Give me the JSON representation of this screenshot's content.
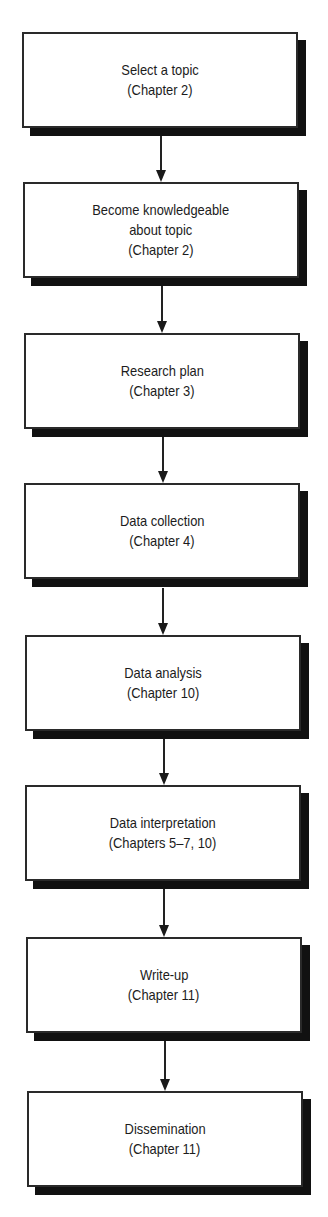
{
  "flowchart": {
    "steps": [
      {
        "lines": [
          "Select a topic",
          "(Chapter 2)"
        ],
        "x": 22,
        "y": 32
      },
      {
        "lines": [
          "Become knowledgeable",
          "about topic",
          "(Chapter 2)"
        ],
        "x": 23,
        "y": 182
      },
      {
        "lines": [
          "Research plan",
          "(Chapter 3)"
        ],
        "x": 24,
        "y": 333
      },
      {
        "lines": [
          "Data collection",
          "(Chapter 4)"
        ],
        "x": 24,
        "y": 483
      },
      {
        "lines": [
          "Data analysis",
          "(Chapter 10)"
        ],
        "x": 25,
        "y": 635
      },
      {
        "lines": [
          "Data interpretation",
          "(Chapters 5–7, 10)"
        ],
        "x": 25,
        "y": 785
      },
      {
        "lines": [
          "Write-up",
          "(Chapter 11)"
        ],
        "x": 26,
        "y": 937
      },
      {
        "lines": [
          "Dissemination",
          "(Chapter 11)"
        ],
        "x": 27,
        "y": 1091
      }
    ],
    "arrows": [
      {
        "x": 155,
        "y1": 136,
        "y2": 182
      },
      {
        "x": 156,
        "y1": 286,
        "y2": 333
      },
      {
        "x": 157,
        "y1": 437,
        "y2": 483
      },
      {
        "x": 157,
        "y1": 588,
        "y2": 635
      },
      {
        "x": 158,
        "y1": 739,
        "y2": 785
      },
      {
        "x": 158,
        "y1": 889,
        "y2": 937
      },
      {
        "x": 159,
        "y1": 1041,
        "y2": 1091
      }
    ]
  }
}
